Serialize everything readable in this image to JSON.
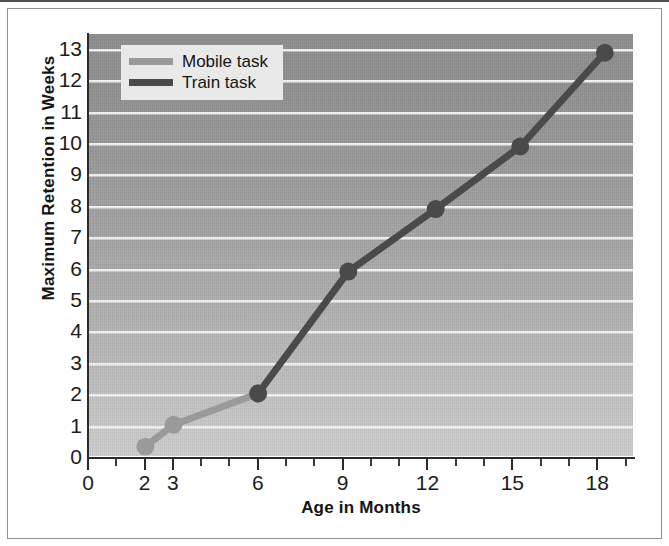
{
  "chart_data": {
    "type": "line",
    "title": "",
    "xlabel": "Age in Months",
    "ylabel": "Maximum Retention in Weeks",
    "xlim": [
      0,
      19.3
    ],
    "ylim": [
      0,
      13.5
    ],
    "grid": true,
    "grid_orientation": "horizontal",
    "legend_position": "top-left",
    "xticks": [
      0,
      2,
      3,
      6,
      9,
      12,
      15,
      18
    ],
    "xtick_labels": [
      "0",
      "2",
      "3",
      "6",
      "9",
      "12",
      "15",
      "18"
    ],
    "xticks_minor": [
      1,
      4,
      5,
      7,
      8,
      10,
      11,
      13,
      14,
      16,
      17,
      19
    ],
    "yticks": [
      0,
      1,
      2,
      3,
      4,
      5,
      6,
      7,
      8,
      9,
      10,
      11,
      12,
      13
    ],
    "ytick_labels": [
      "0",
      "1",
      "2",
      "3",
      "4",
      "5",
      "6",
      "7",
      "8",
      "9",
      "10",
      "11",
      "12",
      "13"
    ],
    "series": [
      {
        "name": "Mobile task",
        "color": "#9a9a9a",
        "marker": "circle",
        "x": [
          2.0,
          3.0,
          6.0
        ],
        "y": [
          0.3,
          1.0,
          2.0
        ],
        "points": [
          {
            "x": 2.0,
            "y": 0.3
          },
          {
            "x": 3.0,
            "y": 1.0
          },
          {
            "x": 6.0,
            "y": 2.0
          }
        ]
      },
      {
        "name": "Train task",
        "color": "#4a4a4a",
        "marker": "circle",
        "x": [
          6.0,
          9.2,
          12.3,
          15.3,
          18.3
        ],
        "y": [
          2.0,
          5.9,
          7.9,
          9.9,
          12.9
        ],
        "points": [
          {
            "x": 6.0,
            "y": 2.0
          },
          {
            "x": 9.2,
            "y": 5.9
          },
          {
            "x": 12.3,
            "y": 7.9
          },
          {
            "x": 15.3,
            "y": 9.9
          },
          {
            "x": 18.3,
            "y": 12.9
          }
        ]
      }
    ]
  },
  "legend": {
    "entries": [
      {
        "label": "Mobile task",
        "color": "#9a9a9a"
      },
      {
        "label": "Train task",
        "color": "#4a4a4a"
      }
    ]
  },
  "colors": {
    "mobile_task": "#9a9a9a",
    "train_task": "#4a4a4a",
    "gridline": "#f4f4f4",
    "axis": "#2b2b2b",
    "legend_background": "#e9e9e9",
    "plot_background_top": "#8e8e8e",
    "plot_background_bottom": "#cfcfcf",
    "frame": "#8e9095"
  }
}
